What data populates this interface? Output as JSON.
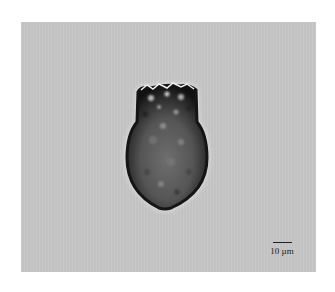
{
  "image": {
    "subject": "single-celled microorganism (light micrograph)",
    "background_color": "#c6c6c6",
    "border_color": "#ffffff"
  },
  "scale_bar": {
    "label": "10 µm",
    "length_px": 19
  }
}
